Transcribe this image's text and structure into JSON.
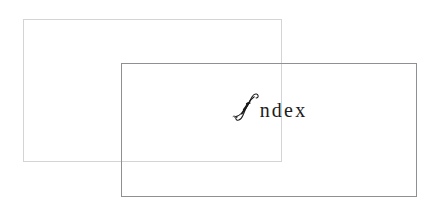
{
  "page": {
    "width": 431,
    "height": 213,
    "background_color": "#ffffff"
  },
  "title": {
    "full_text": "Index",
    "initial_letter": "I",
    "remaining_letters": "ndex",
    "style": "calligraphic swash capital with serif lowercase",
    "text_color": "#1a1a1a"
  },
  "frames": [
    {
      "name": "back-frame",
      "x": 23,
      "y": 19,
      "width": 259,
      "height": 143,
      "border_color": "#d4d4d4",
      "fill": "none"
    },
    {
      "name": "front-frame",
      "x": 121,
      "y": 63,
      "width": 296,
      "height": 134,
      "border_color": "#8e9094",
      "fill": "none"
    }
  ]
}
